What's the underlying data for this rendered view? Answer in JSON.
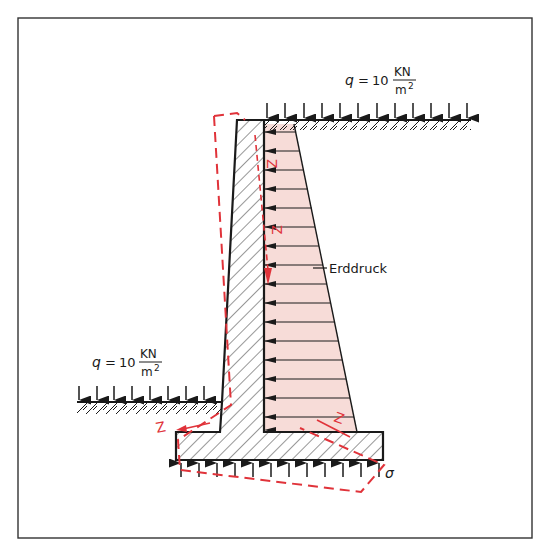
{
  "diagram": {
    "title_visible": false,
    "colors": {
      "ink": "#1a1a1a",
      "load_fill": "#f7dcd8",
      "tension_red": "#e0333a",
      "frame": "#333333",
      "background": "#ffffff"
    },
    "labels": {
      "top_load": {
        "symbol": "q",
        "equals": "=",
        "value": "10",
        "unit_num": "KN",
        "unit_den": "m",
        "unit_den_exp": "2"
      },
      "left_load": {
        "symbol": "q",
        "equals": "=",
        "value": "10",
        "unit_num": "KN",
        "unit_den": "m",
        "unit_den_exp": "2"
      },
      "earth_pressure": "Erddruck",
      "soil_stress": "σ",
      "tension_marks": [
        "Z",
        "Z",
        "Z",
        "Z"
      ]
    },
    "elements": [
      {
        "name": "retaining-wall-stem",
        "type": "hatched concrete"
      },
      {
        "name": "retaining-wall-footing",
        "type": "hatched concrete"
      },
      {
        "name": "earth-pressure-distribution",
        "type": "trapezoid load, arrows pointing left"
      },
      {
        "name": "deformed-shape",
        "type": "red dashed outline"
      },
      {
        "name": "soil-reaction",
        "type": "upward arrows under footing"
      },
      {
        "name": "surcharge-top",
        "type": "downward arrows on backfill"
      },
      {
        "name": "surcharge-left",
        "type": "downward arrows on front soil"
      }
    ]
  }
}
